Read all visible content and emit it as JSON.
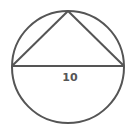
{
  "diagram": {
    "type": "circle-with-inscribed-triangle",
    "circle": {
      "cx": 68,
      "cy": 67,
      "r": 56
    },
    "triangle": {
      "apex": [
        68,
        11
      ],
      "base_left": [
        12,
        66
      ],
      "base_right": [
        124,
        66
      ]
    },
    "diameter_label": "10",
    "stroke_color": "#555555"
  }
}
